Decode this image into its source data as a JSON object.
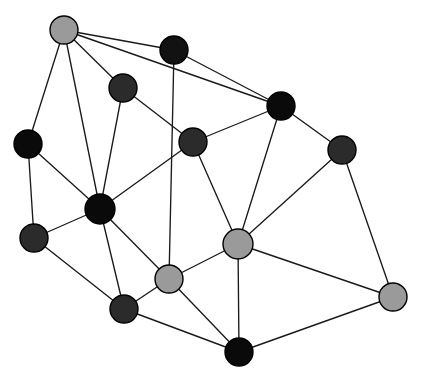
{
  "figure": {
    "kind": "graph-network-diagram",
    "title": "",
    "width": 421,
    "height": 381,
    "background_color": "#ffffff",
    "node_outline_color": "#000000",
    "edge_color": "#1a1a1a",
    "edge_width": 1.35,
    "node_radius": 14,
    "node_count": 14,
    "edge_count": 29
  },
  "palette": {
    "black": "#0a0a0a",
    "dark_gray": "#2b2b2b",
    "light_gray": "#9a9a9a"
  },
  "nodes": [
    {
      "id": "n0",
      "label": "",
      "x": 64,
      "y": 30,
      "r": 14,
      "color": "#9a9a9a",
      "shade": "light_gray",
      "degree": 4
    },
    {
      "id": "n1",
      "label": "",
      "x": 174,
      "y": 50,
      "r": 14,
      "color": "#121212",
      "shade": "black",
      "degree": 3
    },
    {
      "id": "n2",
      "label": "",
      "x": 123,
      "y": 88,
      "r": 14,
      "color": "#2b2b2b",
      "shade": "dark_gray",
      "degree": 3
    },
    {
      "id": "n3",
      "label": "",
      "x": 281,
      "y": 106,
      "r": 14,
      "color": "#0a0a0a",
      "shade": "black",
      "degree": 4
    },
    {
      "id": "n4",
      "label": "",
      "x": 28,
      "y": 144,
      "r": 14,
      "color": "#0a0a0a",
      "shade": "black",
      "degree": 3
    },
    {
      "id": "n5",
      "label": "",
      "x": 193,
      "y": 142,
      "r": 14,
      "color": "#2b2b2b",
      "shade": "dark_gray",
      "degree": 4
    },
    {
      "id": "n6",
      "label": "",
      "x": 342,
      "y": 150,
      "r": 14,
      "color": "#2b2b2b",
      "shade": "dark_gray",
      "degree": 3
    },
    {
      "id": "n7",
      "label": "",
      "x": 100,
      "y": 209,
      "r": 15,
      "color": "#0a0a0a",
      "shade": "black",
      "degree": 7
    },
    {
      "id": "n8",
      "label": "",
      "x": 34,
      "y": 238,
      "r": 14,
      "color": "#2b2b2b",
      "shade": "dark_gray",
      "degree": 3
    },
    {
      "id": "n9",
      "label": "",
      "x": 238,
      "y": 244,
      "r": 15,
      "color": "#9a9a9a",
      "shade": "light_gray",
      "degree": 6
    },
    {
      "id": "n10",
      "label": "",
      "x": 169,
      "y": 279,
      "r": 14,
      "color": "#9a9a9a",
      "shade": "light_gray",
      "degree": 5
    },
    {
      "id": "n11",
      "label": "",
      "x": 393,
      "y": 297,
      "r": 14,
      "color": "#9a9a9a",
      "shade": "light_gray",
      "degree": 3
    },
    {
      "id": "n12",
      "label": "",
      "x": 124,
      "y": 309,
      "r": 14,
      "color": "#2b2b2b",
      "shade": "dark_gray",
      "degree": 4
    },
    {
      "id": "n13",
      "label": "",
      "x": 239,
      "y": 352,
      "r": 14,
      "color": "#0a0a0a",
      "shade": "black",
      "degree": 4
    }
  ],
  "edges": [
    {
      "source": "n0",
      "target": "n1"
    },
    {
      "source": "n0",
      "target": "n2"
    },
    {
      "source": "n0",
      "target": "n4"
    },
    {
      "source": "n0",
      "target": "n7"
    },
    {
      "source": "n1",
      "target": "n3"
    },
    {
      "source": "n1",
      "target": "n10"
    },
    {
      "source": "n2",
      "target": "n5"
    },
    {
      "source": "n2",
      "target": "n7"
    },
    {
      "source": "n3",
      "target": "n5"
    },
    {
      "source": "n3",
      "target": "n6"
    },
    {
      "source": "n3",
      "target": "n9"
    },
    {
      "source": "n4",
      "target": "n7"
    },
    {
      "source": "n4",
      "target": "n8"
    },
    {
      "source": "n5",
      "target": "n7"
    },
    {
      "source": "n5",
      "target": "n9"
    },
    {
      "source": "n6",
      "target": "n9"
    },
    {
      "source": "n6",
      "target": "n11"
    },
    {
      "source": "n7",
      "target": "n8"
    },
    {
      "source": "n7",
      "target": "n10"
    },
    {
      "source": "n7",
      "target": "n12"
    },
    {
      "source": "n8",
      "target": "n12"
    },
    {
      "source": "n9",
      "target": "n10"
    },
    {
      "source": "n9",
      "target": "n11"
    },
    {
      "source": "n9",
      "target": "n13"
    },
    {
      "source": "n10",
      "target": "n12"
    },
    {
      "source": "n10",
      "target": "n13"
    },
    {
      "source": "n11",
      "target": "n13"
    },
    {
      "source": "n12",
      "target": "n13"
    },
    {
      "source": "n0",
      "target": "n3"
    }
  ]
}
